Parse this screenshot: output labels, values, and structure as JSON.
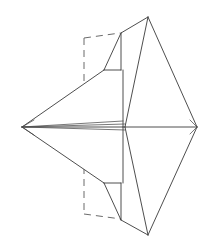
{
  "figure": {
    "type": "line-diagram",
    "background_color": "#ffffff",
    "solid_line_color": "#3a3a3a",
    "hidden_line_color": "#6b6b6b",
    "canvas": {
      "width": 209,
      "height": 251
    },
    "labels": [],
    "vertices": {
      "left_apex": [
        22,
        127
      ],
      "top_peak": [
        148,
        17
      ],
      "right_point": [
        197,
        127
      ],
      "bottom_peak": [
        148,
        235
      ],
      "mid_top_step_outer": [
        121,
        33
      ],
      "mid_top_step_inner": [
        121,
        70
      ],
      "mid_top_step_left": [
        104,
        70
      ],
      "mid_bottom_step_left": [
        104,
        183
      ],
      "mid_bottom_step_inner": [
        121,
        183
      ],
      "mid_bottom_step_outer": [
        121,
        220
      ],
      "center_spine_right": [
        125,
        127
      ],
      "upper_fold": [
        104,
        70
      ],
      "lower_fold": [
        104,
        183
      ]
    },
    "hidden_construction": {
      "top_rect_left_x": 84,
      "top_rect_top_y": 38,
      "top_rect_bottom_y": 86,
      "bottom_rect_left_x": 84,
      "bottom_rect_top_y": 167,
      "bottom_rect_bottom_y": 214
    },
    "edges": [
      {
        "name": "top-peak-to-right-point",
        "from": "top_peak",
        "to": "right_point",
        "style": "solid"
      },
      {
        "name": "right-point-to-bottom-peak",
        "from": "right_point",
        "to": "bottom_peak",
        "style": "solid"
      },
      {
        "name": "top-peak-to-center-spine",
        "from": "top_peak",
        "to": "center_spine_right",
        "style": "solid"
      },
      {
        "name": "bottom-peak-to-center-spine",
        "from": "bottom_peak",
        "to": "center_spine_right",
        "style": "solid"
      },
      {
        "name": "center-horizontal-spine",
        "from": "left_apex",
        "to": "right_point",
        "style": "solid"
      },
      {
        "name": "upper-left-long-edge",
        "from": "left_apex",
        "to": "upper_fold",
        "style": "solid"
      },
      {
        "name": "lower-left-long-edge",
        "from": "left_apex",
        "to": "lower_fold",
        "style": "solid"
      },
      {
        "name": "top-step-vertical-outer",
        "from": "mid_top_step_outer",
        "to": "mid_top_step_inner",
        "style": "solid"
      },
      {
        "name": "top-step-horizontal",
        "from": "mid_top_step_left",
        "to": "mid_top_step_inner",
        "style": "solid"
      },
      {
        "name": "bottom-step-horizontal",
        "from": "mid_bottom_step_left",
        "to": "mid_bottom_step_inner",
        "style": "solid"
      },
      {
        "name": "bottom-step-vertical-outer",
        "from": "mid_bottom_step_inner",
        "to": "mid_bottom_step_outer",
        "style": "solid"
      },
      {
        "name": "top-fan-left",
        "from": "mid_top_step_outer",
        "to": "upper_fold",
        "style": "solid"
      },
      {
        "name": "bottom-fan-left",
        "from": "mid_bottom_step_outer",
        "to": "lower_fold",
        "style": "solid"
      },
      {
        "name": "hidden-top-horizontal",
        "style": "dashed"
      },
      {
        "name": "hidden-top-vertical",
        "style": "dashed"
      },
      {
        "name": "hidden-bottom-horizontal",
        "style": "dashed"
      },
      {
        "name": "hidden-bottom-vertical",
        "style": "dashed"
      }
    ]
  }
}
